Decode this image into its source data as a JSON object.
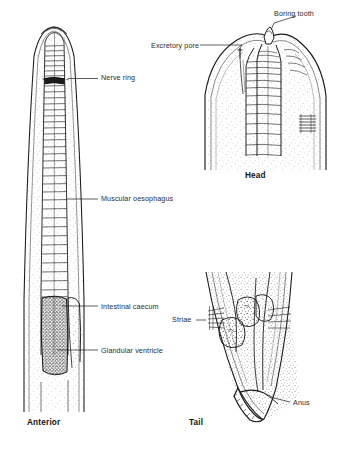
{
  "figure": {
    "type": "scientific-illustration",
    "background_color": "#ffffff",
    "ink_color": "#1a1a1a",
    "panels": [
      {
        "id": "anterior",
        "caption": "Anterior",
        "labels": [
          "Nerve ring",
          "Muscular oesophagus",
          "Intestinal caecum",
          "Glandular ventricle"
        ]
      },
      {
        "id": "head",
        "caption": "Head",
        "labels": [
          "Boring tooth",
          "Excretory pore"
        ]
      },
      {
        "id": "tail",
        "caption": "Tail",
        "labels": [
          "Striae",
          "Anus"
        ]
      }
    ]
  },
  "labels": {
    "nerve_ring": "Nerve ring",
    "muscular_oesophagus": "Muscular oesophagus",
    "intestinal_caecum": "Intestinal caecum",
    "glandular_ventricle": "Glandular ventricle",
    "boring_tooth": "Boring tooth",
    "excretory_pore": "Excretory pore",
    "striae": "Striae",
    "anus": "Anus"
  },
  "captions": {
    "anterior": "Anterior",
    "head": "Head",
    "tail": "Tail"
  }
}
